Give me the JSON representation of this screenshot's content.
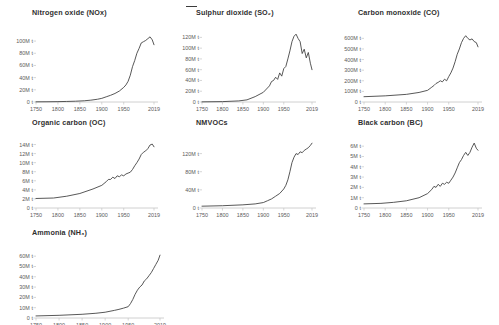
{
  "figure": {
    "top_marker": "—",
    "background_color": "#ffffff",
    "line_color": "#3a3a3a",
    "axis_color": "#c4c4c4",
    "title_color": "#2f2f2f",
    "tick_color": "#5a5a5a"
  },
  "chart_data": [
    {
      "type": "line",
      "title": "Nitrogen oxide (NOx)",
      "xlabel": "",
      "ylabel": "",
      "xlim": [
        1750,
        2019
      ],
      "ylim": [
        0,
        110000000
      ],
      "grid": false,
      "legend": "none",
      "xticklabels": [
        "1750",
        "1800",
        "1850",
        "1900",
        "1950",
        "2019"
      ],
      "xtickvalues": [
        1750,
        1800,
        1850,
        1900,
        1950,
        2019
      ],
      "yticklabels": [
        "0 t",
        "20M t",
        "40M t",
        "60M t",
        "80M t",
        "100M t"
      ],
      "ytickvalues": [
        0,
        20000000,
        40000000,
        60000000,
        80000000,
        100000000
      ],
      "x": [
        1750,
        1775,
        1800,
        1820,
        1840,
        1860,
        1875,
        1890,
        1900,
        1910,
        1920,
        1930,
        1940,
        1950,
        1955,
        1960,
        1965,
        1970,
        1975,
        1980,
        1985,
        1990,
        1995,
        2000,
        2005,
        2010,
        2015,
        2019
      ],
      "values": [
        300000,
        400000,
        600000,
        900000,
        1300000,
        2000000,
        3000000,
        4500000,
        6000000,
        8500000,
        11000000,
        14000000,
        18000000,
        24000000,
        28000000,
        34000000,
        44000000,
        58000000,
        68000000,
        80000000,
        88000000,
        97000000,
        99000000,
        101000000,
        104000000,
        107000000,
        102000000,
        94000000
      ]
    },
    {
      "type": "line",
      "title": "Sulphur dioxide (SO₂)",
      "xlabel": "",
      "ylabel": "",
      "xlim": [
        1750,
        2019
      ],
      "ylim": [
        0,
        130000000
      ],
      "grid": false,
      "legend": "none",
      "xticklabels": [
        "1750",
        "1800",
        "1850",
        "1900",
        "1950",
        "2019"
      ],
      "xtickvalues": [
        1750,
        1800,
        1850,
        1900,
        1950,
        2019
      ],
      "yticklabels": [
        "0 t",
        "20M t",
        "40M t",
        "60M t",
        "80M t",
        "100M t",
        "120M t"
      ],
      "ytickvalues": [
        0,
        20000000,
        40000000,
        60000000,
        80000000,
        100000000,
        120000000
      ],
      "x": [
        1750,
        1800,
        1840,
        1860,
        1880,
        1900,
        1910,
        1915,
        1920,
        1925,
        1930,
        1935,
        1940,
        1945,
        1950,
        1955,
        1960,
        1965,
        1970,
        1975,
        1980,
        1985,
        1990,
        1995,
        2000,
        2005,
        2010,
        2015,
        2019
      ],
      "values": [
        300000,
        700000,
        2000000,
        4000000,
        10000000,
        18000000,
        26000000,
        30000000,
        38000000,
        40000000,
        46000000,
        42000000,
        54000000,
        48000000,
        62000000,
        66000000,
        80000000,
        95000000,
        112000000,
        122000000,
        126000000,
        118000000,
        112000000,
        90000000,
        98000000,
        82000000,
        92000000,
        72000000,
        60000000
      ]
    },
    {
      "type": "line",
      "title": "Carbon monoxide (CO)",
      "xlabel": "",
      "ylabel": "",
      "xlim": [
        1750,
        2019
      ],
      "ylim": [
        0,
        660000000
      ],
      "grid": false,
      "legend": "none",
      "xticklabels": [
        "1750",
        "1800",
        "1850",
        "1900",
        "1950",
        "2019"
      ],
      "xtickvalues": [
        1750,
        1800,
        1850,
        1900,
        1950,
        2019
      ],
      "yticklabels": [
        "0 t",
        "100M t",
        "200M t",
        "300M t",
        "400M t",
        "500M t",
        "600M t"
      ],
      "ytickvalues": [
        0,
        100000000,
        200000000,
        300000000,
        400000000,
        500000000,
        600000000
      ],
      "x": [
        1750,
        1800,
        1850,
        1880,
        1900,
        1910,
        1915,
        1920,
        1925,
        1930,
        1935,
        1940,
        1945,
        1950,
        1955,
        1960,
        1965,
        1970,
        1975,
        1980,
        1985,
        1990,
        1995,
        2000,
        2005,
        2010,
        2015,
        2019
      ],
      "values": [
        50000000,
        58000000,
        72000000,
        90000000,
        110000000,
        140000000,
        155000000,
        175000000,
        185000000,
        200000000,
        190000000,
        215000000,
        200000000,
        240000000,
        275000000,
        320000000,
        380000000,
        450000000,
        500000000,
        560000000,
        600000000,
        625000000,
        600000000,
        585000000,
        595000000,
        570000000,
        560000000,
        520000000
      ]
    },
    {
      "type": "line",
      "title": "Organic carbon (OC)",
      "xlabel": "",
      "ylabel": "",
      "xlim": [
        1750,
        2019
      ],
      "ylim": [
        0,
        15000000
      ],
      "grid": false,
      "legend": "none",
      "xticklabels": [
        "1750",
        "1800",
        "1850",
        "1900",
        "1950",
        "2019"
      ],
      "xtickvalues": [
        1750,
        1800,
        1850,
        1900,
        1950,
        2019
      ],
      "yticklabels": [
        "0 t",
        "2M t",
        "4M t",
        "6M t",
        "8M t",
        "10M t",
        "12M t",
        "14M t"
      ],
      "ytickvalues": [
        0,
        2000000,
        4000000,
        6000000,
        8000000,
        10000000,
        12000000,
        14000000
      ],
      "x": [
        1750,
        1790,
        1820,
        1850,
        1880,
        1900,
        1910,
        1915,
        1920,
        1925,
        1930,
        1935,
        1940,
        1945,
        1950,
        1955,
        1960,
        1965,
        1970,
        1975,
        1980,
        1985,
        1990,
        1995,
        2000,
        2005,
        2010,
        2015,
        2019
      ],
      "values": [
        2100000,
        2200000,
        2600000,
        3200000,
        4200000,
        5000000,
        5800000,
        6300000,
        6300000,
        6800000,
        6500000,
        7100000,
        6900000,
        7300000,
        7100000,
        7500000,
        7700000,
        7900000,
        8500000,
        9300000,
        10000000,
        10800000,
        11800000,
        12300000,
        12600000,
        13100000,
        13900000,
        14100000,
        13500000
      ]
    },
    {
      "type": "line",
      "title": "NMVOCs",
      "xlabel": "",
      "ylabel": "",
      "xlim": [
        1750,
        2019
      ],
      "ylim": [
        0,
        150000000
      ],
      "grid": false,
      "legend": "none",
      "xticklabels": [
        "1750",
        "1800",
        "1850",
        "1900",
        "1950",
        "2019"
      ],
      "xtickvalues": [
        1750,
        1800,
        1850,
        1900,
        1950,
        2019
      ],
      "yticklabels": [
        "0 t",
        "40M t",
        "80M t",
        "120M t"
      ],
      "ytickvalues": [
        0,
        40000000,
        80000000,
        120000000
      ],
      "x": [
        1750,
        1800,
        1850,
        1880,
        1900,
        1910,
        1920,
        1930,
        1940,
        1950,
        1955,
        1960,
        1965,
        1970,
        1975,
        1980,
        1985,
        1990,
        1995,
        2000,
        2005,
        2010,
        2015,
        2019
      ],
      "values": [
        4000000,
        5000000,
        7000000,
        9000000,
        12000000,
        16000000,
        20000000,
        26000000,
        32000000,
        42000000,
        50000000,
        62000000,
        80000000,
        100000000,
        112000000,
        120000000,
        118000000,
        124000000,
        122000000,
        127000000,
        130000000,
        133000000,
        138000000,
        143000000
      ]
    },
    {
      "type": "line",
      "title": "Black carbon (BC)",
      "xlabel": "",
      "ylabel": "",
      "xlim": [
        1750,
        2019
      ],
      "ylim": [
        0,
        6600000
      ],
      "grid": false,
      "legend": "none",
      "xticklabels": [
        "1750",
        "1800",
        "1850",
        "1900",
        "1950",
        "2019"
      ],
      "xtickvalues": [
        1750,
        1800,
        1850,
        1900,
        1950,
        2019
      ],
      "yticklabels": [
        "0 t",
        "1M t",
        "2M t",
        "3M t",
        "4M t",
        "5M t",
        "6M t"
      ],
      "ytickvalues": [
        0,
        1000000,
        2000000,
        3000000,
        4000000,
        5000000,
        6000000
      ],
      "x": [
        1750,
        1790,
        1820,
        1850,
        1880,
        1900,
        1910,
        1915,
        1920,
        1925,
        1930,
        1935,
        1940,
        1945,
        1950,
        1955,
        1960,
        1965,
        1970,
        1975,
        1980,
        1985,
        1990,
        1995,
        2000,
        2005,
        2010,
        2015,
        2019
      ],
      "values": [
        400000,
        450000,
        550000,
        700000,
        1000000,
        1400000,
        1800000,
        2100000,
        2000000,
        2300000,
        2100000,
        2400000,
        2300000,
        2500000,
        2400000,
        2700000,
        3000000,
        3400000,
        3900000,
        4400000,
        4700000,
        5100000,
        5400000,
        5100000,
        5400000,
        5900000,
        6300000,
        5800000,
        5600000
      ]
    },
    {
      "type": "line",
      "title": "Ammonia (NH₃)",
      "xlabel": "",
      "ylabel": "",
      "xlim": [
        1750,
        2019
      ],
      "ylim": [
        0,
        66000000
      ],
      "grid": false,
      "legend": "none",
      "xticklabels": [
        "1750",
        "1800",
        "1850",
        "1900",
        "1950",
        "2019"
      ],
      "xtickvalues": [
        1750,
        1800,
        1850,
        1900,
        1950,
        2019
      ],
      "yticklabels": [
        "0 t",
        "10M t",
        "20M t",
        "30M t",
        "40M t",
        "50M t",
        "60M t"
      ],
      "ytickvalues": [
        0,
        10000000,
        20000000,
        30000000,
        40000000,
        50000000,
        60000000
      ],
      "x": [
        1750,
        1800,
        1850,
        1880,
        1900,
        1920,
        1930,
        1940,
        1950,
        1955,
        1960,
        1965,
        1970,
        1975,
        1980,
        1985,
        1990,
        1995,
        2000,
        2005,
        2010,
        2015,
        2019
      ],
      "values": [
        2000000,
        2600000,
        3600000,
        4600000,
        5600000,
        7400000,
        8400000,
        9600000,
        11000000,
        14000000,
        18000000,
        23000000,
        27000000,
        30000000,
        32000000,
        36000000,
        38000000,
        41000000,
        44000000,
        48000000,
        52000000,
        56000000,
        61000000
      ]
    }
  ]
}
